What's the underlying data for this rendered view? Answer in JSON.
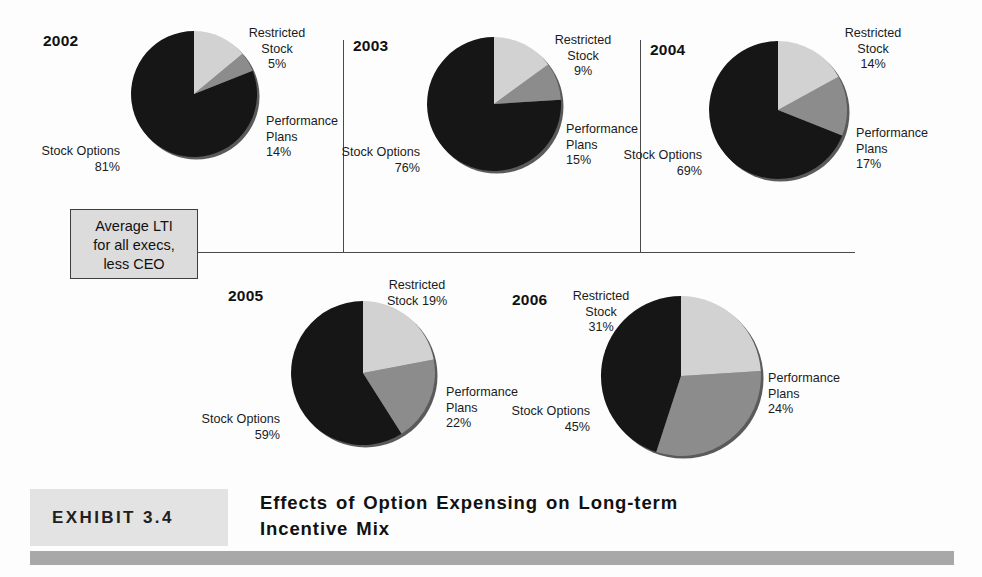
{
  "chart_data": [
    {
      "type": "pie",
      "title": "2002",
      "categories": [
        "Stock Options",
        "Restricted Stock",
        "Performance Plans"
      ],
      "values": [
        81,
        5,
        14
      ],
      "labels": [
        "Stock Options\n81%",
        "Restricted\nStock\n5%",
        "Performance\nPlans\n14%"
      ],
      "colors": [
        "#161616",
        "#8c8c8c",
        "#d2d2d2"
      ],
      "legend": "none",
      "grid": false
    },
    {
      "type": "pie",
      "title": "2003",
      "categories": [
        "Stock Options",
        "Restricted Stock",
        "Performance Plans"
      ],
      "values": [
        76,
        9,
        15
      ],
      "labels": [
        "Stock Options\n76%",
        "Restricted\nStock\n9%",
        "Performance\nPlans\n15%"
      ],
      "colors": [
        "#161616",
        "#8c8c8c",
        "#d2d2d2"
      ],
      "legend": "none",
      "grid": false
    },
    {
      "type": "pie",
      "title": "2004",
      "categories": [
        "Stock Options",
        "Restricted Stock",
        "Performance Plans"
      ],
      "values": [
        69,
        14,
        17
      ],
      "labels": [
        "Stock Options\n69%",
        "Restricted\nStock\n14%",
        "Performance\nPlans\n17%"
      ],
      "colors": [
        "#161616",
        "#8c8c8c",
        "#d2d2d2"
      ],
      "legend": "none",
      "grid": false
    },
    {
      "type": "pie",
      "title": "2005",
      "categories": [
        "Stock Options",
        "Restricted Stock",
        "Performance Plans"
      ],
      "values": [
        59,
        19,
        22
      ],
      "labels": [
        "Stock Options\n59%",
        "Restricted\nStock 19%",
        "Performance\nPlans\n22%"
      ],
      "colors": [
        "#161616",
        "#8c8c8c",
        "#d2d2d2"
      ],
      "legend": "none",
      "grid": false
    },
    {
      "type": "pie",
      "title": "2006",
      "categories": [
        "Stock Options",
        "Restricted Stock",
        "Performance Plans"
      ],
      "values": [
        45,
        31,
        24
      ],
      "labels": [
        "Stock Options\n45%",
        "Restricted\nStock\n31%",
        "Performance\nPlans\n24%"
      ],
      "colors": [
        "#161616",
        "#8c8c8c",
        "#d2d2d2"
      ],
      "legend": "none",
      "grid": false
    }
  ],
  "charts": {
    "y2002": {
      "year": "2002",
      "stock_options_name": "Stock Options",
      "stock_options_pct": "81%",
      "restricted_l1": "Restricted",
      "restricted_l2": "Stock",
      "restricted_pct": "5%",
      "performance_l1": "Performance",
      "performance_l2": "Plans",
      "performance_pct": "14%"
    },
    "y2003": {
      "year": "2003",
      "stock_options_name": "Stock Options",
      "stock_options_pct": "76%",
      "restricted_l1": "Restricted",
      "restricted_l2": "Stock",
      "restricted_pct": "9%",
      "performance_l1": "Performance",
      "performance_l2": "Plans",
      "performance_pct": "15%"
    },
    "y2004": {
      "year": "2004",
      "stock_options_name": "Stock Options",
      "stock_options_pct": "69%",
      "restricted_l1": "Restricted",
      "restricted_l2": "Stock",
      "restricted_pct": "14%",
      "performance_l1": "Performance",
      "performance_l2": "Plans",
      "performance_pct": "17%"
    },
    "y2005": {
      "year": "2005",
      "stock_options_name": "Stock Options",
      "stock_options_pct": "59%",
      "restricted_l1": "Restricted",
      "restricted_l2": "Stock 19%",
      "performance_l1": "Performance",
      "performance_l2": "Plans",
      "performance_pct": "22%"
    },
    "y2006": {
      "year": "2006",
      "stock_options_name": "Stock Options",
      "stock_options_pct": "45%",
      "restricted_l1": "Restricted",
      "restricted_l2": "Stock",
      "restricted_pct": "31%",
      "performance_l1": "Performance",
      "performance_l2": "Plans",
      "performance_pct": "24%"
    }
  },
  "callout": {
    "line1": "Average LTI",
    "line2": "for all execs,",
    "line3": "less CEO"
  },
  "exhibit": {
    "tag": "EXHIBIT 3.4",
    "title_line1": "Effects of Option Expensing on Long-term",
    "title_line2": "Incentive Mix"
  },
  "colors": {
    "stock_options": "#161616",
    "restricted_stock": "#8c8c8c",
    "performance_plans": "#d2d2d2",
    "callout_bg": "#dcdcdc",
    "exhibit_tag_bg": "#e3e3e3",
    "footer_bar": "#a8a8a8",
    "rule": "#4a4a4a"
  }
}
